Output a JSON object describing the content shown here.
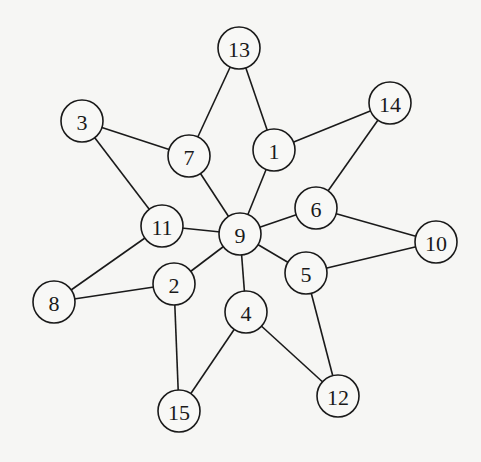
{
  "graph": {
    "node_radius": 21,
    "nodes": [
      {
        "id": "13",
        "label": "13",
        "x": 239,
        "y": 48
      },
      {
        "id": "14",
        "label": "14",
        "x": 390,
        "y": 103
      },
      {
        "id": "3",
        "label": "3",
        "x": 82,
        "y": 121
      },
      {
        "id": "7",
        "label": "7",
        "x": 189,
        "y": 156
      },
      {
        "id": "1",
        "label": "1",
        "x": 274,
        "y": 150
      },
      {
        "id": "6",
        "label": "6",
        "x": 316,
        "y": 208
      },
      {
        "id": "11",
        "label": "11",
        "x": 162,
        "y": 226
      },
      {
        "id": "9",
        "label": "9",
        "x": 240,
        "y": 234
      },
      {
        "id": "10",
        "label": "10",
        "x": 436,
        "y": 242
      },
      {
        "id": "5",
        "label": "5",
        "x": 306,
        "y": 273
      },
      {
        "id": "2",
        "label": "2",
        "x": 174,
        "y": 284
      },
      {
        "id": "8",
        "label": "8",
        "x": 54,
        "y": 302
      },
      {
        "id": "4",
        "label": "4",
        "x": 246,
        "y": 312
      },
      {
        "id": "12",
        "label": "12",
        "x": 338,
        "y": 396
      },
      {
        "id": "15",
        "label": "15",
        "x": 179,
        "y": 411
      }
    ],
    "edges": [
      [
        "13",
        "7"
      ],
      [
        "13",
        "1"
      ],
      [
        "3",
        "7"
      ],
      [
        "3",
        "11"
      ],
      [
        "7",
        "9"
      ],
      [
        "1",
        "14"
      ],
      [
        "1",
        "9"
      ],
      [
        "14",
        "6"
      ],
      [
        "6",
        "9"
      ],
      [
        "6",
        "10"
      ],
      [
        "11",
        "9"
      ],
      [
        "11",
        "8"
      ],
      [
        "8",
        "2"
      ],
      [
        "2",
        "9"
      ],
      [
        "2",
        "15"
      ],
      [
        "9",
        "5"
      ],
      [
        "9",
        "4"
      ],
      [
        "5",
        "10"
      ],
      [
        "5",
        "12"
      ],
      [
        "4",
        "12"
      ],
      [
        "4",
        "15"
      ]
    ]
  }
}
